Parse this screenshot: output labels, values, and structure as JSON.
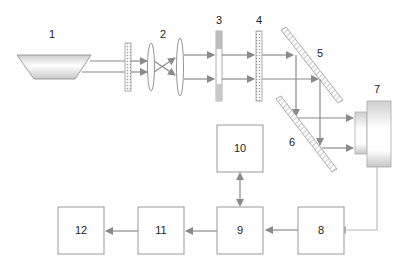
{
  "diagram": {
    "type": "optical-system-block-diagram",
    "components": [
      {
        "id": "1",
        "label": "1",
        "kind": "light-source"
      },
      {
        "id": "2",
        "label": "2",
        "kind": "lens-pair"
      },
      {
        "id": "3",
        "label": "3",
        "kind": "aperture-plate"
      },
      {
        "id": "4",
        "label": "4",
        "kind": "filter-plate"
      },
      {
        "id": "5",
        "label": "5",
        "kind": "mirror"
      },
      {
        "id": "6",
        "label": "6",
        "kind": "mirror"
      },
      {
        "id": "7",
        "label": "7",
        "kind": "detector"
      },
      {
        "id": "8",
        "label": "8",
        "kind": "block"
      },
      {
        "id": "9",
        "label": "9",
        "kind": "block"
      },
      {
        "id": "10",
        "label": "10",
        "kind": "block"
      },
      {
        "id": "11",
        "label": "11",
        "kind": "block"
      },
      {
        "id": "12",
        "label": "12",
        "kind": "block"
      }
    ],
    "connections": [
      {
        "from": "7",
        "to": "8"
      },
      {
        "from": "8",
        "to": "9"
      },
      {
        "from": "9",
        "to": "10",
        "bidirectional": true
      },
      {
        "from": "9",
        "to": "11"
      },
      {
        "from": "11",
        "to": "12"
      }
    ],
    "colors": {
      "line": "#8a8a8a",
      "box_border": "#999999",
      "light_line": "#b5b5b5",
      "text": "#222222"
    }
  }
}
